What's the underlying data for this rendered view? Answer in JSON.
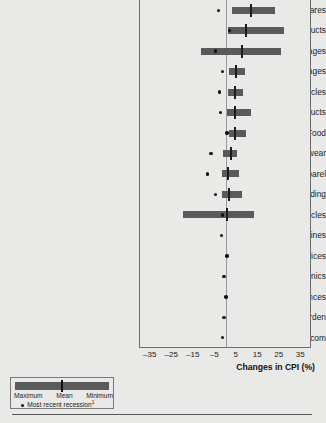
{
  "chart_data": {
    "type": "bar",
    "title": "",
    "subtitle": "",
    "xlabel": "Changes in CPI (%)",
    "ylabel": "",
    "xlim": [
      -40,
      40
    ],
    "xticks": [
      -35,
      -25,
      -15,
      -5,
      5,
      15,
      25,
      35
    ],
    "xtick_labels": [
      "–35",
      "–25",
      "–15",
      "–5",
      "5",
      "15",
      "25",
      "35"
    ],
    "grid": false,
    "zero_reference_line": 0,
    "orientation": "horizontal",
    "categories": [
      "Airline fares",
      "Household products",
      "Nonalcoholic beverages",
      "Alcoholic beverages",
      "New vehicles",
      "Personal care products",
      "Food",
      "Footwear",
      "Apparel",
      "Furniture and bedding",
      "Used vehicles",
      "Newspapers and magazines",
      "Delivery services",
      "Consumer electronics",
      "Appliances",
      "Home and garden",
      "Telecom"
    ],
    "series": [
      {
        "name": "Minimum",
        "values": [
          3.0,
          1.0,
          -11.5,
          1.5,
          1.0,
          0.5,
          1.5,
          -1.5,
          -2.0,
          -2.0,
          -20.0,
          null,
          null,
          null,
          null,
          null,
          null
        ]
      },
      {
        "name": "Mean",
        "values": [
          11.5,
          9.5,
          7.5,
          4.5,
          4.0,
          4.0,
          4.0,
          2.5,
          1.0,
          1.5,
          0.5,
          null,
          null,
          null,
          null,
          null,
          null
        ]
      },
      {
        "name": "Maximum",
        "values": [
          23.0,
          27.0,
          25.5,
          9.0,
          8.0,
          11.5,
          9.5,
          5.0,
          6.0,
          7.5,
          13.0,
          null,
          null,
          null,
          null,
          null,
          null
        ]
      },
      {
        "name": "Most recent recession",
        "values": [
          -3.5,
          1.5,
          -5.0,
          -1.5,
          -3.0,
          -2.5,
          0.5,
          -7.0,
          -8.5,
          -5.0,
          -1.5,
          -2.0,
          0.5,
          -1.0,
          0.0,
          -1.0,
          -1.5
        ]
      }
    ],
    "legend": {
      "position": "bottom-left",
      "range_labels": [
        "Maximum",
        "Mean",
        "Minimum"
      ],
      "recession_label": "Most recent recession",
      "recession_footnote": "1"
    }
  },
  "axis": {
    "title": "Changes in CPI (%)"
  },
  "colors": {
    "background": "#e9e9e7",
    "bar": "#5a5a5a",
    "mean_tick": "#1c1c1c",
    "dot": "#111111",
    "axis_line": "#6d6d6d",
    "zero_line": "#9a9a9a"
  }
}
